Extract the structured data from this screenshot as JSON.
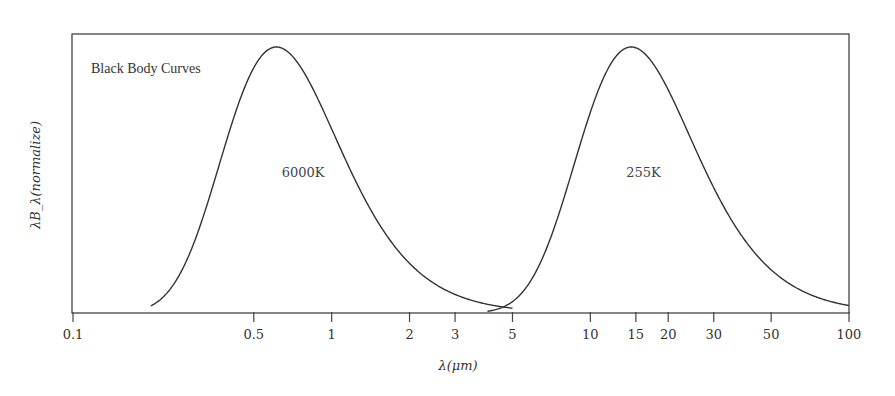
{
  "chart_data": {
    "type": "line",
    "title": "Black Body Curves",
    "xlabel": "λ(μm)",
    "ylabel": "λB_λ(normalize)",
    "xscale": "log",
    "xlim": [
      0.1,
      100
    ],
    "ylim": [
      0,
      1.05
    ],
    "xticks": [
      {
        "value": 0.1,
        "label": "0.1"
      },
      {
        "value": 0.5,
        "label": "0.5"
      },
      {
        "value": 1,
        "label": "1"
      },
      {
        "value": 2,
        "label": "2"
      },
      {
        "value": 3,
        "label": "3"
      },
      {
        "value": 5,
        "label": "5"
      },
      {
        "value": 10,
        "label": "10"
      },
      {
        "value": 15,
        "label": "15"
      },
      {
        "value": 20,
        "label": "20"
      },
      {
        "value": 30,
        "label": "30"
      },
      {
        "value": 50,
        "label": "50"
      },
      {
        "value": 100,
        "label": "100"
      }
    ],
    "grid": false,
    "series": [
      {
        "name": "6000K",
        "temperature_K": 6000,
        "label": "6000K",
        "label_at": [
          1.0,
          0.55
        ],
        "peak_wavelength_um": 0.63,
        "x_range": [
          0.2,
          5
        ]
      },
      {
        "name": "255K",
        "temperature_K": 255,
        "label": "255K",
        "label_at": [
          20,
          0.55
        ],
        "peak_wavelength_um": 15,
        "x_range": [
          4,
          100
        ]
      }
    ]
  }
}
